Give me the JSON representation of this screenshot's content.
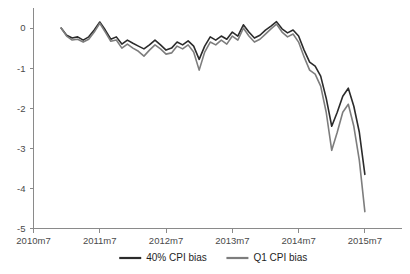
{
  "chart_data": {
    "type": "line",
    "title": "",
    "subtitle": "",
    "xlabel": "",
    "ylabel": "",
    "grid": false,
    "legend_position": "bottom",
    "xlim": [
      0,
      66
    ],
    "ylim": [
      -5,
      0.5
    ],
    "y_ticks": [
      0,
      -1,
      -2,
      -3,
      -4,
      -5
    ],
    "y_tick_labels": [
      "0",
      "-1",
      "-2",
      "-3",
      "-4",
      "-5"
    ],
    "x_ticks": [
      0,
      12,
      24,
      36,
      48,
      60
    ],
    "x_tick_labels": [
      "2010m7",
      "2011m7",
      "2012m7",
      "2013m7",
      "2014m7",
      "2015m7"
    ],
    "x_start_index": 5,
    "series": [
      {
        "name": "40% CPI bias",
        "color": "#2b2b2b",
        "values": [
          0.0,
          -0.18,
          -0.25,
          -0.22,
          -0.3,
          -0.22,
          -0.05,
          0.15,
          -0.05,
          -0.28,
          -0.22,
          -0.4,
          -0.3,
          -0.38,
          -0.45,
          -0.52,
          -0.42,
          -0.3,
          -0.42,
          -0.55,
          -0.5,
          -0.35,
          -0.42,
          -0.32,
          -0.45,
          -0.78,
          -0.45,
          -0.22,
          -0.3,
          -0.2,
          -0.28,
          -0.1,
          -0.2,
          0.08,
          -0.1,
          -0.25,
          -0.18,
          -0.05,
          0.05,
          0.16,
          -0.02,
          -0.12,
          -0.05,
          -0.2,
          -0.55,
          -0.85,
          -0.95,
          -1.2,
          -1.75,
          -2.45,
          -2.1,
          -1.7,
          -1.5,
          -1.95,
          -2.6,
          -3.65
        ]
      },
      {
        "name": "Q1 CPI bias",
        "color": "#7d7d7d",
        "values": [
          0.0,
          -0.2,
          -0.3,
          -0.28,
          -0.35,
          -0.28,
          -0.1,
          0.12,
          -0.1,
          -0.33,
          -0.3,
          -0.5,
          -0.4,
          -0.5,
          -0.58,
          -0.7,
          -0.55,
          -0.42,
          -0.52,
          -0.65,
          -0.62,
          -0.45,
          -0.52,
          -0.42,
          -0.6,
          -1.05,
          -0.6,
          -0.35,
          -0.42,
          -0.3,
          -0.4,
          -0.2,
          -0.3,
          0.0,
          -0.2,
          -0.35,
          -0.28,
          -0.15,
          -0.02,
          0.1,
          -0.1,
          -0.22,
          -0.15,
          -0.35,
          -0.72,
          -1.05,
          -1.15,
          -1.45,
          -2.1,
          -3.05,
          -2.6,
          -2.1,
          -1.9,
          -2.45,
          -3.3,
          -4.58
        ]
      }
    ]
  },
  "legend": {
    "items": [
      {
        "label": "40% CPI bias",
        "color": "#2b2b2b"
      },
      {
        "label": "Q1 CPI bias",
        "color": "#7d7d7d"
      }
    ]
  }
}
